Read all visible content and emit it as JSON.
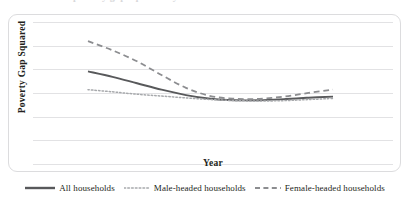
{
  "figure": {
    "clipped_title_remnant": "Trends in poverty gap squared by sex of household head"
  },
  "axes": {
    "y_title": "Poverty  Gap Squared",
    "x_title": "Year",
    "gridlines_visible": true,
    "gridline_count": 7,
    "tick_labels_visible": false
  },
  "legend": {
    "position": "bottom-center",
    "entries": [
      {
        "label": "All households",
        "style": "solid",
        "color": "#58595b",
        "icon": "solid-line-swatch-icon"
      },
      {
        "label": "Male-headed households",
        "style": "dotted",
        "color": "#a7a9ac",
        "icon": "dotted-line-swatch-icon"
      },
      {
        "label": "Female-headed households",
        "style": "dashed",
        "color": "#8c8d90",
        "icon": "dashed-line-swatch-icon"
      }
    ]
  },
  "chart_data": {
    "type": "line",
    "title": "",
    "xlabel": "Year",
    "ylabel": "Poverty  Gap Squared",
    "grid": true,
    "legend_position": "bottom",
    "x_tick_labels": [],
    "y_tick_labels": [],
    "xlim": [
      0,
      10
    ],
    "ylim": [
      0,
      7
    ],
    "x": [
      0,
      1,
      2,
      3,
      4,
      5,
      6,
      7,
      8,
      9,
      10
    ],
    "series": [
      {
        "name": "All households",
        "style": "solid",
        "color": "#58595b",
        "values": [
          4.3,
          4.0,
          3.65,
          3.3,
          3.0,
          2.8,
          2.72,
          2.72,
          2.78,
          2.86,
          2.92
        ]
      },
      {
        "name": "Male-headed households",
        "style": "dotted",
        "color": "#a7a9ac",
        "values": [
          3.3,
          3.18,
          3.05,
          2.95,
          2.85,
          2.76,
          2.7,
          2.68,
          2.7,
          2.76,
          2.82
        ]
      },
      {
        "name": "Female-headed households",
        "style": "dashed",
        "color": "#8c8d90",
        "values": [
          5.95,
          5.45,
          4.85,
          4.1,
          3.4,
          2.95,
          2.8,
          2.8,
          2.92,
          3.12,
          3.3
        ]
      }
    ]
  }
}
